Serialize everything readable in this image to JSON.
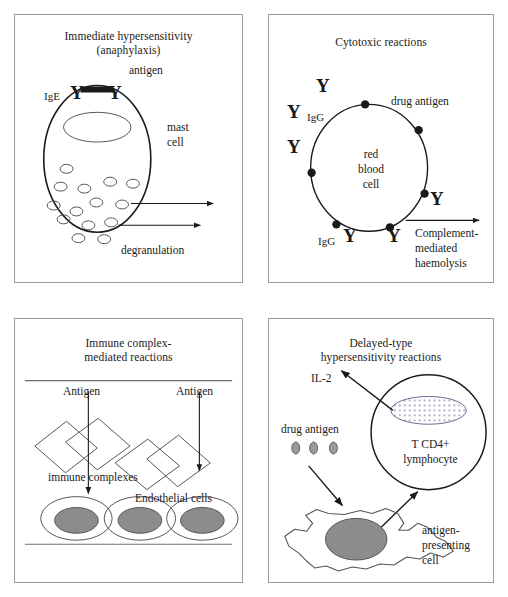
{
  "figure": {
    "name": "drug-hypersensitivity-reaction-types",
    "background": "#ffffff",
    "stroke": "#1a1a1a",
    "panel_border": "#9a9a9a",
    "nucleus_fill": "#8c8c8c"
  },
  "panels": [
    {
      "id": "panel-1",
      "title_line1": "Immediate hypersensitivity",
      "title_line2": "(anaphylaxis)",
      "labels": {
        "antigen": "antigen",
        "ige": "IgE",
        "antibody_left": "Y",
        "antibody_right": "Y",
        "mast_line1": "mast",
        "mast_line2": "cell",
        "degranulation": "degranulation"
      },
      "granule_count": 14
    },
    {
      "id": "panel-2",
      "title_line1": "Cytotoxic reactions",
      "title_line2": "",
      "labels": {
        "drug_antigen": "drug antigen",
        "igg_upper": "IgG",
        "igg_lower": "IgG",
        "rbc_line1": "red",
        "rbc_line2": "blood",
        "rbc_line3": "cell",
        "outcome_line1": "Complement-",
        "outcome_line2": "mediated",
        "outcome_line3": "haemolysis",
        "antibody": "Y"
      },
      "antibody_count": 6,
      "antigen_dot_count": 6
    },
    {
      "id": "panel-3",
      "title_line1": "Immune complex-",
      "title_line2": "mediated reactions",
      "labels": {
        "antigen_left": "Antigen",
        "antigen_right": "Antigen",
        "immune_complexes": "immune complexes",
        "endothelial_cells": "Endothelial cells"
      },
      "complex_count": 4,
      "endothelial_cell_count": 3
    },
    {
      "id": "panel-4",
      "title_line1": "Delayed-type",
      "title_line2": "hypersensitivity reactions",
      "labels": {
        "il2": "IL-2",
        "drug_antigen": "drug antigen",
        "lymphocyte_line1": "T CD4+",
        "lymphocyte_line2": "lymphocyte",
        "apc_line1": "antigen-",
        "apc_line2": "presenting",
        "apc_line3": "cell"
      },
      "drug_antigen_dot_count": 3
    }
  ]
}
